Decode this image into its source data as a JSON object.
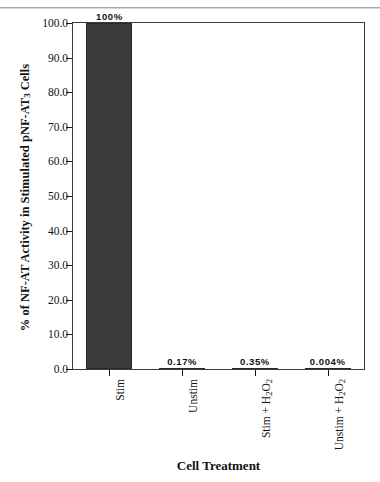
{
  "figure": {
    "background_color": "#ffffff",
    "frame_color": "#3a3a3a",
    "bar_color": "#3b3b3b"
  },
  "chart_data": {
    "type": "bar",
    "title": "",
    "xlabel": "Cell Treatment",
    "ylabel": "% of NF-AT Activity in Stimulated pNF-AT3 Cells",
    "ylabel_parts": {
      "before_sub": "% of NF-AT Activity in Stimulated pNF-AT",
      "sub": "3",
      "after_sub": " Cells"
    },
    "categories": [
      "Stim",
      "Unstim",
      "Stim + H2O2",
      "Unstim + H2O2"
    ],
    "category_parts": [
      {
        "text": "Stim",
        "subs": []
      },
      {
        "text": "Unstim",
        "subs": []
      },
      {
        "before": "Stim + H",
        "sub1": "2",
        "mid": "O",
        "sub2": "2"
      },
      {
        "before": "Unstim + H",
        "sub1": "2",
        "mid": "O",
        "sub2": "2"
      }
    ],
    "values": [
      100,
      0.17,
      0.35,
      0.004
    ],
    "value_labels": [
      "100%",
      "0.17%",
      "0.35%",
      "0.004%"
    ],
    "ylim": [
      0,
      100
    ],
    "ytick_values": [
      0,
      10,
      20,
      30,
      40,
      50,
      60,
      70,
      80,
      90,
      100
    ],
    "ytick_labels": [
      "0.0",
      "10.0",
      "20.0",
      "30.0",
      "40.0",
      "50.0",
      "60.0",
      "70.0",
      "80.0",
      "90.0",
      "100.0"
    ],
    "grid": false,
    "legend": "none"
  }
}
